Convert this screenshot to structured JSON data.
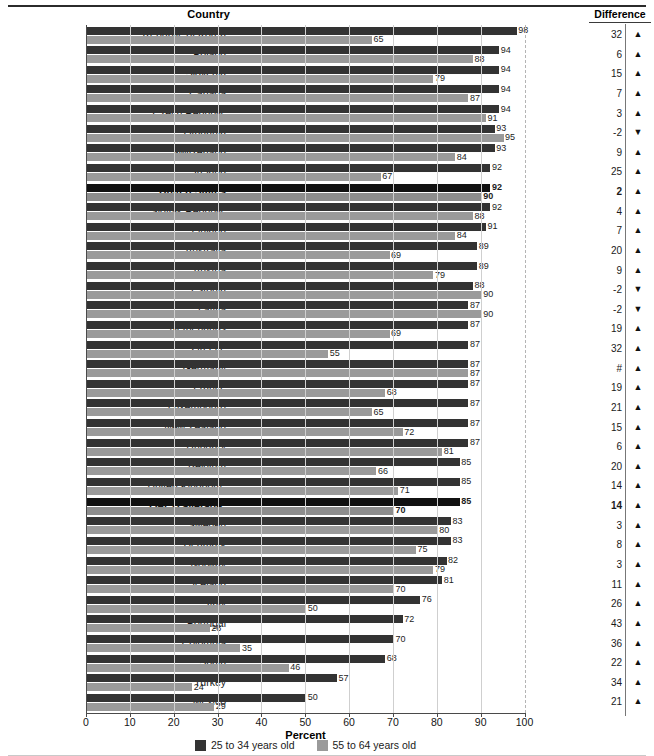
{
  "header": {
    "country_label": "Country",
    "difference_label": "Difference",
    "partial_top_text": ""
  },
  "axis": {
    "x_title": "Percent",
    "ticks": [
      0,
      10,
      20,
      30,
      40,
      50,
      60,
      70,
      80,
      90,
      100
    ],
    "xlim": [
      0,
      100
    ]
  },
  "legend": {
    "items": [
      {
        "label": "25 to 34 years old",
        "color": "#333333",
        "key": "young"
      },
      {
        "label": "55 to 64 years old",
        "color": "#9a9a9a",
        "key": "old"
      }
    ]
  },
  "chart_data": {
    "type": "bar",
    "title": "",
    "xlabel": "Percent",
    "ylabel": "Country",
    "xlim": [
      0,
      100
    ],
    "grid": true,
    "orientation": "horizontal",
    "legend_position": "bottom",
    "categories": [
      "Republic of Korea",
      "Poland",
      "Slovenia",
      "Canada",
      "Czech Republic",
      "Lithuania",
      "Switzerland",
      "Ireland",
      "United States",
      "Slovak Republic",
      "Finland",
      "Australia",
      "Austria",
      "Estonia",
      "Latvia",
      "Netherlands",
      "Greece",
      "Germany",
      "France",
      "Luxembourg",
      "New Zealand",
      "Hungary",
      "Belgium",
      "United Kingdom",
      "OECD average",
      "Sweden",
      "Denmark",
      "Norway",
      "Iceland",
      "Italy",
      "Portugal",
      "Colombia",
      "Spain",
      "Turkey",
      "Mexico"
    ],
    "series": [
      {
        "name": "25 to 34 years old",
        "color": "#333333",
        "values": [
          98,
          94,
          94,
          94,
          94,
          93,
          93,
          92,
          92,
          92,
          91,
          89,
          89,
          88,
          87,
          87,
          87,
          87,
          87,
          87,
          87,
          87,
          85,
          85,
          85,
          83,
          83,
          82,
          81,
          76,
          72,
          70,
          68,
          57,
          50
        ]
      },
      {
        "name": "55 to 64 years old",
        "color": "#9a9a9a",
        "values": [
          65,
          88,
          79,
          87,
          91,
          95,
          84,
          67,
          90,
          88,
          84,
          69,
          79,
          90,
          90,
          69,
          55,
          87,
          68,
          65,
          72,
          81,
          66,
          71,
          70,
          80,
          75,
          79,
          70,
          50,
          28,
          35,
          46,
          24,
          29
        ]
      }
    ],
    "difference": [
      "32",
      "6",
      "15",
      "7",
      "3",
      "-2",
      "9",
      "25",
      "2",
      "4",
      "7",
      "20",
      "9",
      "-2",
      "-2",
      "19",
      "32",
      "#",
      "19",
      "21",
      "15",
      "6",
      "20",
      "14",
      "14",
      "3",
      "8",
      "3",
      "11",
      "26",
      "43",
      "36",
      "22",
      "34",
      "21"
    ],
    "difference_direction": [
      "up",
      "up",
      "up",
      "up",
      "up",
      "down",
      "up",
      "up",
      "up",
      "up",
      "up",
      "up",
      "up",
      "down",
      "down",
      "up",
      "up",
      "up",
      "up",
      "up",
      "up",
      "up",
      "up",
      "up",
      "up",
      "up",
      "up",
      "up",
      "up",
      "up",
      "up",
      "up",
      "up",
      "up",
      "up"
    ],
    "footnote_markers": {
      "United Kingdom": "1",
      "OECD average": "2"
    },
    "emphasized_rows": [
      "United States",
      "OECD average"
    ]
  },
  "icons": {
    "up_arrow": "▲",
    "down_arrow": "▼"
  }
}
